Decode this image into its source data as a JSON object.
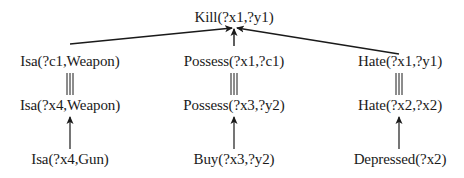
{
  "diagram": {
    "type": "explanation-tree",
    "root": {
      "id": "kill",
      "label": "Kill(?x1,?y1)"
    },
    "columns": [
      {
        "id": "weapon",
        "level1": "Isa(?c1,Weapon)",
        "level2": "Isa(?x4,Weapon)",
        "level3": "Isa(?x4,Gun)"
      },
      {
        "id": "possess",
        "level1": "Possess(?x1,?c1)",
        "level2": "Possess(?x3,?y2)",
        "level3": "Buy(?x3,?y2)"
      },
      {
        "id": "hate",
        "level1": "Hate(?x1,?y1)",
        "level2": "Hate(?x2,?x2)",
        "level3": "Depressed(?x2)"
      }
    ],
    "edge_types": {
      "level1_to_root": "arrow",
      "level2_to_level1": "triple-line-unification",
      "level3_to_level2": "arrow"
    },
    "colors": {
      "ink": "#1a1a1a",
      "background": "#ffffff"
    }
  }
}
